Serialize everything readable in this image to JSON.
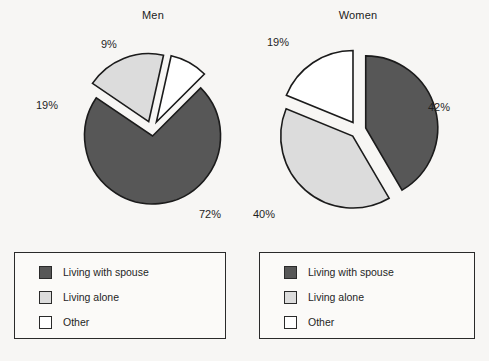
{
  "figure": {
    "background_color": "#f7f6f4",
    "stroke_color": "#1b1b1b"
  },
  "colors": {
    "living_with_spouse": "#575757",
    "living_alone": "#dcdcdc",
    "other": "#ffffff"
  },
  "legend": {
    "items": [
      {
        "label": "Living with spouse",
        "color_key": "living_with_spouse",
        "swatch_color": "#575757"
      },
      {
        "label": "Living alone",
        "color_key": "living_alone",
        "swatch_color": "#dcdcdc"
      },
      {
        "label": "Other",
        "color_key": "other",
        "swatch_color": "#ffffff"
      }
    ]
  },
  "chart_data": [
    {
      "type": "pie",
      "title": "Men",
      "labels": [
        "Living with spouse",
        "Living alone",
        "Other"
      ],
      "values": [
        72,
        19,
        9
      ],
      "value_labels": [
        "72%",
        "19%",
        "9%"
      ],
      "colors": [
        "#575757",
        "#dcdcdc",
        "#ffffff"
      ],
      "exploded": true,
      "legend_position": "below",
      "legend_entries": [
        "Living with spouse",
        "Living alone",
        "Other"
      ]
    },
    {
      "type": "pie",
      "title": "Women",
      "labels": [
        "Living with spouse",
        "Living alone",
        "Other"
      ],
      "values": [
        42,
        40,
        19
      ],
      "value_labels": [
        "42%",
        "40%",
        "19%"
      ],
      "colors": [
        "#575757",
        "#dcdcdc",
        "#ffffff"
      ],
      "exploded": true,
      "legend_position": "below",
      "legend_entries": [
        "Living with spouse",
        "Living alone",
        "Other"
      ]
    }
  ]
}
